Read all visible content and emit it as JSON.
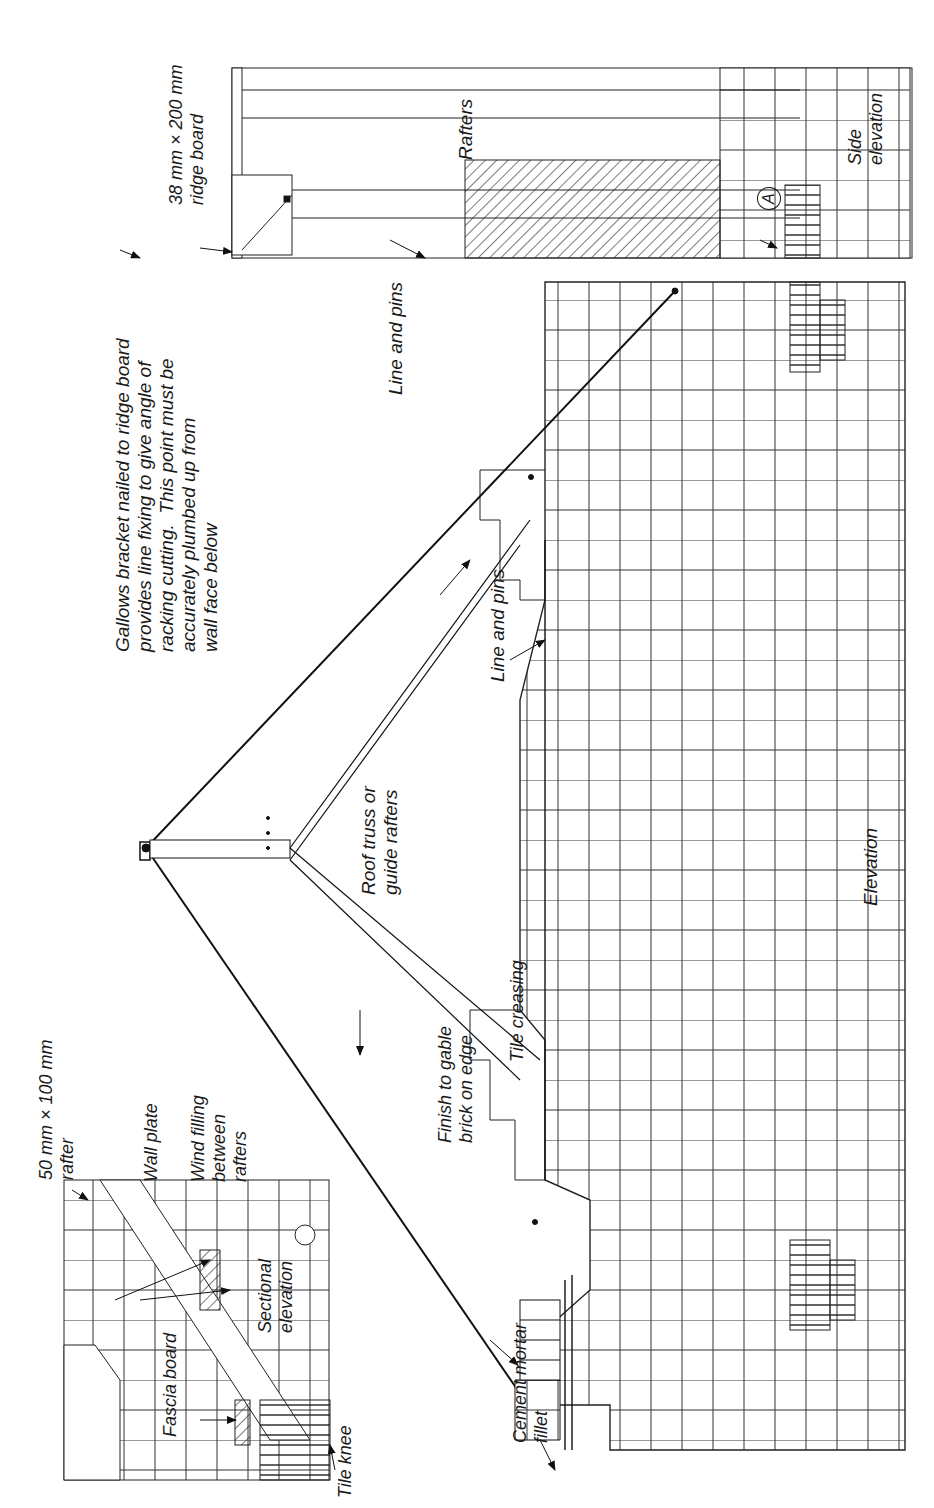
{
  "figure": {
    "views": [
      "Elevation",
      "Sectional elevation",
      "Side elevation"
    ]
  },
  "labels": {
    "gallows_note": "Gallows bracket nailed to ridge board\nprovides line fixing to give angle of\nracking cutting.  This point must be\naccurately plumbed up from\nwall face below",
    "ridge_board": "38 mm × 200 mm\nridge board",
    "rafters": "Rafters",
    "side_elevation": "Side\nelevation",
    "section_marker": "A",
    "line_and_pins_upper": "Line and pins",
    "line_and_pins_lower": "Line and pins",
    "roof_truss": "Roof truss or\nguide rafters",
    "elevation": "Elevation",
    "tile_creasing": "Tile creasing",
    "finish_to_gable": "Finish to gable\nbrick on edge",
    "cement_mortar_fillet": "Cement mortar\nfillet",
    "rafter_size": "50 mm × 100 mm\nrafter",
    "wall_plate": "Wall plate",
    "wind_filling": "Wind filling\nbetween\nrafters",
    "fascia_board": "Fascia board",
    "sectional_elevation": "Sectional\nelevation",
    "tile_knee": "Tile knee"
  },
  "colors": {
    "ink": "#1a1a1a",
    "paper": "#ffffff"
  }
}
